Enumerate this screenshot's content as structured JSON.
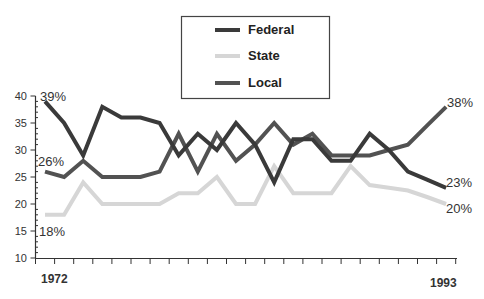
{
  "chart_data": {
    "type": "line",
    "title": "",
    "xlabel": "",
    "ylabel": "",
    "x": [
      1972,
      1973,
      1974,
      1975,
      1976,
      1977,
      1978,
      1979,
      1980,
      1981,
      1982,
      1983,
      1984,
      1985,
      1986,
      1987,
      1988,
      1989,
      1990,
      1991,
      1992,
      1993
    ],
    "x_tick_labels": [
      "1972",
      "1993"
    ],
    "y_ticks": [
      10,
      15,
      20,
      25,
      30,
      35,
      40
    ],
    "ylim": [
      10,
      40
    ],
    "grid": false,
    "legend_position": "top-center",
    "series": [
      {
        "name": "Federal",
        "color": "#3a3a3a",
        "values": [
          39,
          35,
          29,
          38,
          36,
          36,
          35,
          29,
          33,
          30,
          35,
          31,
          24,
          32,
          32,
          28,
          28,
          33,
          30,
          26,
          24.5,
          23
        ]
      },
      {
        "name": "State",
        "color": "#d6d6d6",
        "values": [
          18,
          18,
          24,
          20,
          20,
          20,
          20,
          22,
          22,
          25,
          20,
          20,
          27,
          22,
          22,
          22,
          27,
          23.5,
          23,
          22.5,
          21.3,
          20
        ]
      },
      {
        "name": "Local",
        "color": "#525252",
        "values": [
          26,
          25,
          28,
          25,
          25,
          25,
          26,
          33,
          26,
          33,
          28,
          31,
          35,
          31,
          33,
          29,
          29,
          29,
          30,
          31,
          34.5,
          38
        ]
      }
    ],
    "annotations": [
      {
        "text": "39%",
        "series": "Federal",
        "year": 1972
      },
      {
        "text": "26%",
        "series": "Local",
        "year": 1972
      },
      {
        "text": "18%",
        "series": "State",
        "year": 1972
      },
      {
        "text": "38%",
        "series": "Local",
        "year": 1993
      },
      {
        "text": "23%",
        "series": "Federal",
        "year": 1993
      },
      {
        "text": "20%",
        "series": "State",
        "year": 1993
      }
    ]
  },
  "legend": {
    "items": [
      {
        "label": "Federal",
        "color": "#3a3a3a"
      },
      {
        "label": "State",
        "color": "#d6d6d6"
      },
      {
        "label": "Local",
        "color": "#525252"
      }
    ]
  },
  "labels": {
    "start_year": "1972",
    "end_year": "1993",
    "federal_start": "39%",
    "local_start": "26%",
    "state_start": "18%",
    "local_end": "38%",
    "federal_end": "23%",
    "state_end": "20%"
  },
  "axis": {
    "y_labels": [
      "40",
      "35",
      "30",
      "25",
      "20",
      "15",
      "10"
    ]
  }
}
